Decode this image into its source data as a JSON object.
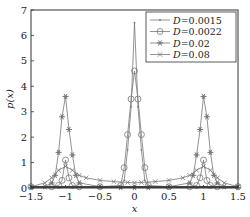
{
  "chart_data": {
    "type": "line",
    "title": "",
    "xlabel": "x",
    "ylabel": "p(x)",
    "xlim": [
      -1.5,
      1.5
    ],
    "ylim": [
      0,
      7
    ],
    "xticks": [
      "-1.5",
      "-1",
      "-0.5",
      "0",
      "0.5",
      "1",
      "1.5"
    ],
    "yticks": [
      "0",
      "1",
      "2",
      "3",
      "4",
      "5",
      "6",
      "7"
    ],
    "grid": false,
    "legend_position": "upper right",
    "series": [
      {
        "name": "D=0.0015",
        "marker": "dot",
        "x": [
          -1.5,
          -1.2,
          -1.1,
          -1.05,
          -1.0,
          -0.95,
          -0.9,
          -0.8,
          -0.5,
          -0.2,
          -0.15,
          -0.1,
          -0.05,
          0.0,
          0.05,
          0.1,
          0.15,
          0.2,
          0.5,
          0.8,
          0.9,
          0.95,
          1.0,
          1.05,
          1.1,
          1.2,
          1.5
        ],
        "y": [
          0.05,
          0.05,
          0.05,
          0.05,
          0.05,
          0.05,
          0.05,
          0.05,
          0.05,
          0.05,
          0.3,
          1.5,
          3.2,
          6.5,
          3.2,
          1.5,
          0.3,
          0.05,
          0.05,
          0.05,
          0.05,
          0.05,
          0.05,
          0.05,
          0.05,
          0.05,
          0.05
        ]
      },
      {
        "name": "D=0.0022",
        "marker": "circle",
        "x": [
          -1.5,
          -1.2,
          -1.1,
          -1.05,
          -1.0,
          -0.95,
          -0.9,
          -0.8,
          -0.5,
          -0.2,
          -0.15,
          -0.1,
          -0.05,
          0.0,
          0.05,
          0.1,
          0.15,
          0.2,
          0.5,
          0.8,
          0.9,
          0.95,
          1.0,
          1.05,
          1.1,
          1.2,
          1.5
        ],
        "y": [
          0.05,
          0.05,
          0.1,
          0.3,
          1.1,
          0.4,
          0.1,
          0.05,
          0.05,
          0.1,
          0.8,
          2.1,
          3.5,
          4.6,
          3.5,
          2.1,
          0.8,
          0.1,
          0.05,
          0.05,
          0.1,
          0.4,
          1.1,
          0.3,
          0.1,
          0.05,
          0.05
        ]
      },
      {
        "name": "D=0.02",
        "marker": "asterisk",
        "x": [
          -1.5,
          -1.3,
          -1.2,
          -1.15,
          -1.1,
          -1.05,
          -1.0,
          -0.95,
          -0.9,
          -0.85,
          -0.8,
          -0.5,
          -0.2,
          0.0,
          0.2,
          0.5,
          0.8,
          0.85,
          0.9,
          0.95,
          1.0,
          1.05,
          1.1,
          1.15,
          1.2,
          1.3,
          1.5
        ],
        "y": [
          0.02,
          0.05,
          0.2,
          0.5,
          1.4,
          2.8,
          3.6,
          2.3,
          1.3,
          0.5,
          0.2,
          0.05,
          0.02,
          0.02,
          0.02,
          0.05,
          0.2,
          0.5,
          1.3,
          2.3,
          3.6,
          2.8,
          1.4,
          0.5,
          0.2,
          0.05,
          0.02
        ]
      },
      {
        "name": "D=0.08",
        "marker": "x",
        "x": [
          -1.5,
          -1.3,
          -1.2,
          -1.1,
          -1.0,
          -0.9,
          -0.8,
          -0.7,
          -0.5,
          -0.3,
          -0.1,
          0.0,
          0.1,
          0.3,
          0.5,
          0.7,
          0.8,
          0.9,
          1.0,
          1.1,
          1.2,
          1.3,
          1.5
        ],
        "y": [
          0.05,
          0.2,
          0.4,
          0.7,
          0.85,
          0.7,
          0.5,
          0.4,
          0.3,
          0.25,
          0.22,
          0.2,
          0.22,
          0.25,
          0.3,
          0.4,
          0.5,
          0.7,
          0.85,
          0.7,
          0.4,
          0.2,
          0.05
        ]
      }
    ]
  },
  "legend": {
    "entries": [
      "D=0.0015",
      "D=0.0022",
      "D=0.02",
      "D=0.08"
    ]
  },
  "axes": {
    "xlabel": "x",
    "ylabel": "p(x)",
    "xticks": [
      "−1.5",
      "−1",
      "−0.5",
      "0",
      "0.5",
      "1",
      "1.5"
    ],
    "yticks": [
      "0",
      "1",
      "2",
      "3",
      "4",
      "5",
      "6",
      "7"
    ]
  },
  "colors": {
    "axis": "#333333",
    "series": "#777777"
  }
}
